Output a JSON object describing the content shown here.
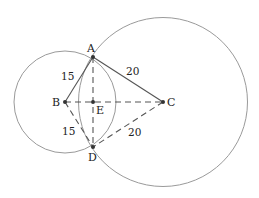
{
  "diagram": {
    "circles": [
      {
        "id": "circle-b",
        "center": "B",
        "radius_units": 15
      },
      {
        "id": "circle-c",
        "center": "C",
        "radius_units": 20
      }
    ],
    "points": {
      "A": {
        "label": "A"
      },
      "B": {
        "label": "B"
      },
      "C": {
        "label": "C"
      },
      "D": {
        "label": "D"
      },
      "E": {
        "label": "E"
      }
    },
    "segments": [
      {
        "id": "AB",
        "from": "A",
        "to": "B",
        "style": "solid",
        "length_label": "15"
      },
      {
        "id": "AC",
        "from": "A",
        "to": "C",
        "style": "solid",
        "length_label": "20"
      },
      {
        "id": "BD",
        "from": "B",
        "to": "D",
        "style": "dashed",
        "length_label": "15"
      },
      {
        "id": "CD",
        "from": "C",
        "to": "D",
        "style": "dashed",
        "length_label": "20"
      },
      {
        "id": "BC",
        "from": "B",
        "to": "C",
        "style": "dashed",
        "length_label": ""
      },
      {
        "id": "AD",
        "from": "A",
        "to": "D",
        "style": "dashed",
        "length_label": ""
      }
    ],
    "labels": {
      "ab": "15",
      "ac": "20",
      "bd": "15",
      "cd": "20"
    }
  }
}
